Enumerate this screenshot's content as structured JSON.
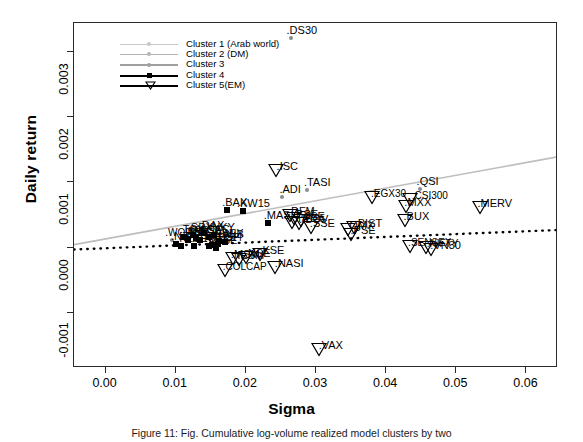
{
  "chart_data": {
    "type": "scatter",
    "title": "",
    "xlabel": "Sigma",
    "ylabel": "Daily return",
    "xlim": [
      -0.0045,
      0.0645
    ],
    "ylim": [
      -0.00185,
      0.00345
    ],
    "xticks": [
      "0.00",
      "0.01",
      "0.02",
      "0.03",
      "0.04",
      "0.05",
      "0.06"
    ],
    "xtick_values": [
      0.0,
      0.01,
      0.02,
      0.03,
      0.04,
      0.05,
      0.06
    ],
    "yticks": [
      "-0.001",
      "0.000",
      "0.001",
      "0.002",
      "0.003"
    ],
    "ytick_values": [
      -0.001,
      0.0,
      0.001,
      0.002,
      0.003
    ],
    "grid": false,
    "legend_position": "top-left",
    "legend": [
      {
        "label": "Cluster 1 (Arab world)",
        "marker": "dot",
        "color": "#c8c8c8"
      },
      {
        "label": "Cluster 2 (DM)",
        "marker": "dot",
        "color": "#b4b4b4"
      },
      {
        "label": "Cluster 3",
        "marker": "dot",
        "color": "#a0a0a0"
      },
      {
        "label": "Cluster 4",
        "marker": "square",
        "color": "#000000"
      },
      {
        "label": "Cluster 5(EM)",
        "marker": "triangle-down",
        "color": "#000000"
      }
    ],
    "trend_lines": [
      {
        "name": "grey-regression",
        "style": "solid",
        "color": "#bdbdbd",
        "x0": -0.0045,
        "y0": 4.5e-05,
        "x1": 0.0645,
        "y1": 0.001395
      },
      {
        "name": "black-regression",
        "style": "dotted",
        "color": "#000000",
        "x0": -0.0045,
        "y0": -3e-05,
        "x1": 0.0645,
        "y1": 0.00027
      }
    ],
    "points": [
      {
        "label": "DS30",
        "x": 0.0265,
        "y": 0.00322,
        "cluster": 1
      },
      {
        "label": "ISC",
        "x": 0.0248,
        "y": 0.00113,
        "cluster": 5
      },
      {
        "label": "TASI",
        "x": 0.0287,
        "y": 0.00088,
        "cluster": 1
      },
      {
        "label": "ADI",
        "x": 0.0252,
        "y": 0.00078,
        "cluster": 1
      },
      {
        "label": "QSI",
        "x": 0.0448,
        "y": 0.0009,
        "cluster": 1
      },
      {
        "label": "EGX30",
        "x": 0.0385,
        "y": 0.00071,
        "cluster": 5
      },
      {
        "label": "CSI300",
        "x": 0.044,
        "y": 0.00068,
        "cluster": 5
      },
      {
        "label": "MXX",
        "x": 0.0434,
        "y": 0.00058,
        "cluster": 5
      },
      {
        "label": "MERV",
        "x": 0.054,
        "y": 0.00056,
        "cluster": 5
      },
      {
        "label": "BUX",
        "x": 0.0432,
        "y": 0.00036,
        "cluster": 5
      },
      {
        "label": "BAX",
        "x": 0.0173,
        "y": 0.00057,
        "cluster": 4
      },
      {
        "label": "KW15",
        "x": 0.0196,
        "y": 0.00056,
        "cluster": 4
      },
      {
        "label": "DFM",
        "x": 0.0268,
        "y": 0.00044,
        "cluster": 5
      },
      {
        "label": "MASI",
        "x": 0.0232,
        "y": 0.00038,
        "cluster": 4
      },
      {
        "label": "BSE",
        "x": 0.0274,
        "y": 0.0004,
        "cluster": 5
      },
      {
        "label": "JSE",
        "x": 0.0285,
        "y": 0.00036,
        "cluster": 5
      },
      {
        "label": "TA125",
        "x": 0.0272,
        "y": 0.00033,
        "cluster": 5
      },
      {
        "label": "IBOV",
        "x": 0.0282,
        "y": 0.00031,
        "cluster": 5
      },
      {
        "label": "SSE",
        "x": 0.0298,
        "y": 0.00026,
        "cluster": 5
      },
      {
        "label": "BIST",
        "x": 0.036,
        "y": 0.00026,
        "cluster": 5
      },
      {
        "label": "OMX",
        "x": 0.0352,
        "y": 0.00022,
        "cluster": 5
      },
      {
        "label": "PSE",
        "x": 0.0356,
        "y": 0.00014,
        "cluster": 5
      },
      {
        "label": "WORLD",
        "x": 0.0095,
        "y": 0.00011,
        "cluster": 2
      },
      {
        "label": "SPX",
        "x": 0.0124,
        "y": 0.0002,
        "cluster": 4
      },
      {
        "label": "DAX",
        "x": 0.014,
        "y": 0.00022,
        "cluster": 4
      },
      {
        "label": "FTSE",
        "x": 0.0129,
        "y": 0.00014,
        "cluster": 4
      },
      {
        "label": "CAC",
        "x": 0.0147,
        "y": 0.00016,
        "cluster": 4
      },
      {
        "label": "NKY",
        "x": 0.0155,
        "y": 0.00019,
        "cluster": 4
      },
      {
        "label": "SMI",
        "x": 0.0117,
        "y": 0.00013,
        "cluster": 4
      },
      {
        "label": "AEX",
        "x": 0.0135,
        "y": 0.00011,
        "cluster": 4
      },
      {
        "label": "IBEX",
        "x": 0.0162,
        "y": 0.0001,
        "cluster": 4
      },
      {
        "label": "MIB",
        "x": 0.017,
        "y": 8e-05,
        "cluster": 4
      },
      {
        "label": "TSX",
        "x": 0.0112,
        "y": 0.00016,
        "cluster": 4
      },
      {
        "label": "ASX",
        "x": 0.0118,
        "y": 0.00012,
        "cluster": 4
      },
      {
        "label": "HSI",
        "x": 0.016,
        "y": 6e-05,
        "cluster": 4
      },
      {
        "label": "KOSPI",
        "x": 0.0152,
        "y": 4e-05,
        "cluster": 4
      },
      {
        "label": "STI",
        "x": 0.0126,
        "y": 3e-05,
        "cluster": 4
      },
      {
        "label": "SET",
        "x": 0.0148,
        "y": 2e-05,
        "cluster": 4
      },
      {
        "label": "KLSE",
        "x": 0.0108,
        "y": 2e-05,
        "cluster": 4
      },
      {
        "label": "NZX",
        "x": 0.01,
        "y": 5e-05,
        "cluster": 4
      },
      {
        "label": "OSE",
        "x": 0.0158,
        "y": 0.0,
        "cluster": 4
      },
      {
        "label": "KSE",
        "x": 0.0226,
        "y": -0.00016,
        "cluster": 5
      },
      {
        "label": "NSE",
        "x": 0.0206,
        "y": -0.0002,
        "cluster": 5
      },
      {
        "label": "MSM",
        "x": 0.0188,
        "y": -0.00022,
        "cluster": 5
      },
      {
        "label": "ESM",
        "x": 0.0196,
        "y": -0.00024,
        "cluster": 5
      },
      {
        "label": "NASI",
        "x": 0.0247,
        "y": -0.00036,
        "cluster": 5
      },
      {
        "label": "COLCAP",
        "x": 0.0176,
        "y": -0.0004,
        "cluster": 5
      },
      {
        "label": "SENSEX",
        "x": 0.044,
        "y": -4e-05,
        "cluster": 5
      },
      {
        "label": "NIFTY",
        "x": 0.0462,
        "y": -6e-05,
        "cluster": 5
      },
      {
        "label": "VN30",
        "x": 0.047,
        "y": -8e-05,
        "cluster": 5
      },
      {
        "label": "VAX",
        "x": 0.031,
        "y": -0.00162,
        "cluster": 5
      }
    ]
  },
  "caption": {
    "text": "Figure 11: Fig. Cumulative log-volume realized model clusters by two"
  }
}
